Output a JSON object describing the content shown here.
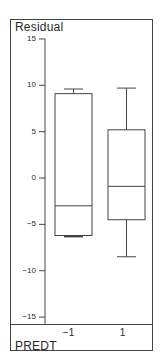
{
  "chart_data": {
    "type": "box",
    "title": "",
    "xlabel": "PREDT",
    "ylabel": "Residual",
    "ylim": [
      -15,
      15
    ],
    "yticks": [
      15,
      10,
      5,
      0,
      -5,
      -10,
      -15
    ],
    "ytick_labels": [
      "15",
      "10",
      "5",
      "0",
      "−5",
      "−10",
      "−15"
    ],
    "categories": [
      "−1",
      "1"
    ],
    "grid": false,
    "boxes": [
      {
        "category": "−1",
        "whisker_low": -6.3,
        "q1": -6.2,
        "median": -3.0,
        "q3": 9.1,
        "whisker_high": 9.6
      },
      {
        "category": "1",
        "whisker_low": -8.5,
        "q1": -4.5,
        "median": -0.9,
        "q3": 5.2,
        "whisker_high": 9.7
      }
    ]
  },
  "labels": {
    "y_axis": "Residual",
    "x_axis": "PREDT"
  },
  "colors": {
    "line": "#444444",
    "text": "#2a2a2a",
    "background": "#ffffff"
  }
}
